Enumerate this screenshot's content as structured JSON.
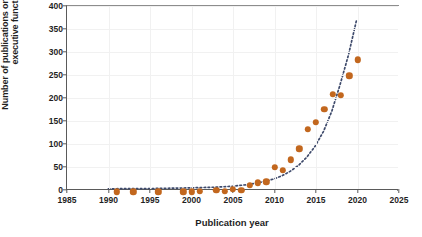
{
  "chart_data": {
    "type": "scatter",
    "title": "",
    "xlabel": "Publication year",
    "ylabel": "Number of publications on exercise and executive function",
    "xlim": [
      1985,
      2025
    ],
    "ylim": [
      0,
      400
    ],
    "xticks": [
      1985,
      1990,
      1995,
      2000,
      2005,
      2010,
      2015,
      2020,
      2025
    ],
    "yticks": [
      0,
      50,
      100,
      150,
      200,
      250,
      300,
      350,
      400
    ],
    "grid": true,
    "legend": "none",
    "marker_color": "#C2671E",
    "trend_color": "#3E4A6B",
    "series": [
      {
        "name": "Publications",
        "marker": "filled-circle",
        "x": [
          1991,
          1993,
          1996,
          1999,
          2000,
          2001,
          2003,
          2004,
          2005,
          2006,
          2007,
          2008,
          2009,
          2010,
          2011,
          2012,
          2013,
          2014,
          2015,
          2016,
          2017,
          2018,
          2019,
          2020
        ],
        "y": [
          1,
          1,
          1,
          1,
          1,
          2,
          5,
          2,
          7,
          4,
          15,
          21,
          23,
          54,
          48,
          71,
          95,
          137,
          152,
          181,
          213,
          211,
          253,
          288
        ]
      },
      {
        "name": "Exponential trend",
        "style": "dotted",
        "x": [
          1990,
          1995,
          2000,
          2003,
          2005,
          2007,
          2009,
          2010,
          2011,
          2012,
          2013,
          2014,
          2015,
          2016,
          2017,
          2018,
          2019,
          2020
        ],
        "y": [
          0.5,
          1,
          2.5,
          4,
          6,
          10,
          17,
          22,
          29,
          39,
          52,
          70,
          94,
          126,
          170,
          228,
          292,
          370
        ]
      }
    ]
  }
}
